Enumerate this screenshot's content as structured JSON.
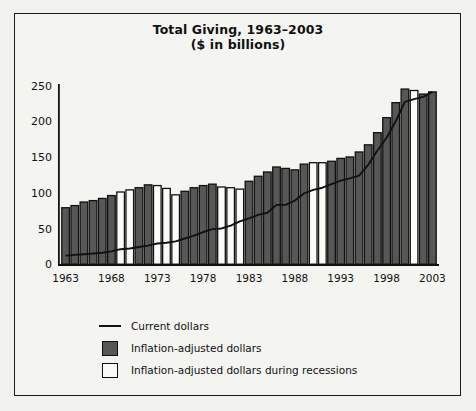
{
  "chart_data": {
    "type": "bar",
    "title": "Total Giving, 1963–2003",
    "subtitle": "($ in billions)",
    "xlabel": "",
    "ylabel": "",
    "ylim": [
      0,
      250
    ],
    "yticks": [
      0,
      50,
      100,
      150,
      200,
      250
    ],
    "xticks": [
      1963,
      1968,
      1973,
      1978,
      1983,
      1988,
      1993,
      1998,
      2003
    ],
    "grid": false,
    "legend_position": "bottom-center",
    "legend": [
      {
        "label": "Current dollars",
        "marker": "line",
        "color": "#111111"
      },
      {
        "label": "Inflation-adjusted dollars",
        "marker": "box",
        "color": "#575757"
      },
      {
        "label": "Inflation-adjusted dollars during recessions",
        "marker": "box",
        "color": "#fbfbf8"
      }
    ],
    "categories": [
      1963,
      1964,
      1965,
      1966,
      1967,
      1968,
      1969,
      1970,
      1971,
      1972,
      1973,
      1974,
      1975,
      1976,
      1977,
      1978,
      1979,
      1980,
      1981,
      1982,
      1983,
      1984,
      1985,
      1986,
      1987,
      1988,
      1989,
      1990,
      1991,
      1992,
      1993,
      1994,
      1995,
      1996,
      1997,
      1998,
      1999,
      2000,
      2001,
      2002,
      2003
    ],
    "series": [
      {
        "name": "Inflation-adjusted dollars",
        "values": [
          79,
          82,
          87,
          89,
          92,
          96,
          101,
          104,
          107,
          111,
          110,
          106,
          97,
          102,
          107,
          110,
          112,
          108,
          107,
          105,
          116,
          123,
          129,
          136,
          134,
          132,
          140,
          142,
          142,
          144,
          148,
          150,
          157,
          167,
          184,
          205,
          226,
          245,
          243,
          238,
          241
        ]
      },
      {
        "name": "Current dollars",
        "values": [
          12,
          13,
          14,
          15,
          16,
          18,
          21,
          22,
          24,
          26,
          29,
          30,
          32,
          36,
          40,
          45,
          49,
          50,
          54,
          60,
          64,
          69,
          72,
          83,
          83,
          89,
          99,
          104,
          107,
          112,
          117,
          120,
          124,
          139,
          159,
          177,
          200,
          227,
          231,
          234,
          241
        ]
      }
    ],
    "recession_years": [
      1969,
      1970,
      1973,
      1974,
      1975,
      1980,
      1981,
      1982,
      1990,
      1991,
      2001
    ]
  }
}
